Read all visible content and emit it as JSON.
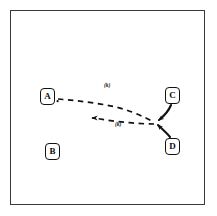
{
  "figure": {
    "canvas": {
      "width": 217,
      "height": 216,
      "background": "#ffffff",
      "border_color": "#3a3a3a",
      "ink_color": "#121212"
    },
    "nodes": [
      {
        "id": "A",
        "label": "A",
        "x": 40,
        "y": 88,
        "name": "node-a"
      },
      {
        "id": "B",
        "label": "B",
        "x": 45,
        "y": 143,
        "name": "node-b"
      },
      {
        "id": "C",
        "label": "C",
        "x": 165,
        "y": 87,
        "name": "node-c"
      },
      {
        "id": "D",
        "label": "D",
        "x": 165,
        "y": 138,
        "name": "node-d"
      }
    ],
    "edges": [
      {
        "id": "edge-a-to-junction",
        "from": "A",
        "to": "junction",
        "style": "dashed",
        "direction": "forward",
        "label": "(k)",
        "label_x": 104,
        "label_y": 83
      },
      {
        "id": "edge-junction-to-left",
        "from": "junction",
        "to": "left-terminus",
        "style": "dashed",
        "direction": "backward",
        "label": "(k)",
        "label_x": 115,
        "label_y": 122
      },
      {
        "id": "edge-c-to-junction",
        "from": "C",
        "to": "junction",
        "style": "solid",
        "direction": "forward",
        "label": ""
      },
      {
        "id": "edge-d-to-junction",
        "from": "D",
        "to": "junction",
        "style": "solid",
        "direction": "forward",
        "label": ""
      }
    ],
    "junction": {
      "x": 155,
      "y": 122
    },
    "left_terminus": {
      "x": 87,
      "y": 120
    }
  }
}
